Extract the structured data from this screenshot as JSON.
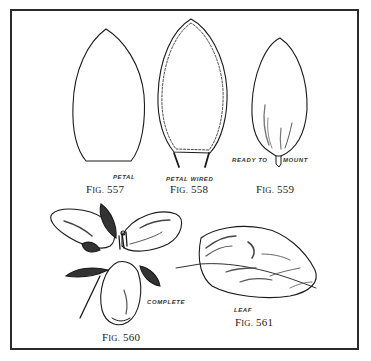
{
  "figures": [
    {
      "id": "fig-557",
      "caption_prefix": "F",
      "caption_small": "IG.",
      "caption_number": "557",
      "label": "PETAL"
    },
    {
      "id": "fig-558",
      "caption_prefix": "F",
      "caption_small": "IG.",
      "caption_number": "558",
      "label": "PETAL WIRED"
    },
    {
      "id": "fig-559",
      "caption_prefix": "F",
      "caption_small": "IG.",
      "caption_number": "559",
      "label_left": "READY TO",
      "label_right": "MOUNT"
    },
    {
      "id": "fig-560",
      "caption_prefix": "F",
      "caption_small": "IG.",
      "caption_number": "560",
      "label": "COMPLETE"
    },
    {
      "id": "fig-561",
      "caption_prefix": "F",
      "caption_small": "IG.",
      "caption_number": "561",
      "label": "LEAF"
    }
  ],
  "colors": {
    "ink": "#1a1a1a",
    "paper": "#ffffff",
    "shade": "#555555"
  }
}
